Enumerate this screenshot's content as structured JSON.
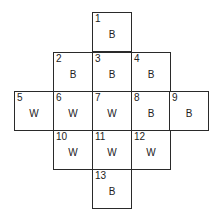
{
  "diagram": {
    "type": "numbered-grid",
    "cells": [
      {
        "id": "1",
        "label": "1",
        "value": "B",
        "col": 2,
        "row": 0
      },
      {
        "id": "2",
        "label": "2",
        "value": "B",
        "col": 1,
        "row": 1
      },
      {
        "id": "3",
        "label": "3",
        "value": "B",
        "col": 2,
        "row": 1
      },
      {
        "id": "4",
        "label": "4",
        "value": "B",
        "col": 3,
        "row": 1
      },
      {
        "id": "5",
        "label": "5",
        "value": "W",
        "col": 0,
        "row": 2
      },
      {
        "id": "6",
        "label": "6",
        "value": "W",
        "col": 1,
        "row": 2
      },
      {
        "id": "7",
        "label": "7",
        "value": "W",
        "col": 2,
        "row": 2
      },
      {
        "id": "8",
        "label": "8",
        "value": "B",
        "col": 3,
        "row": 2
      },
      {
        "id": "9",
        "label": "9",
        "value": "B",
        "col": 4,
        "row": 2
      },
      {
        "id": "10",
        "label": "10",
        "value": "W",
        "col": 1,
        "row": 3
      },
      {
        "id": "11",
        "label": "11",
        "value": "W",
        "col": 2,
        "row": 3
      },
      {
        "id": "12",
        "label": "12",
        "value": "W",
        "col": 3,
        "row": 3
      },
      {
        "id": "13",
        "label": "13",
        "value": "B",
        "col": 2,
        "row": 4
      }
    ]
  }
}
